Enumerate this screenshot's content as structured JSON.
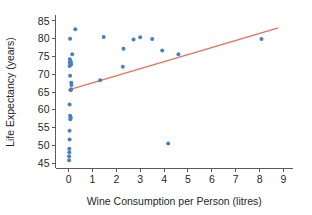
{
  "chart_data": {
    "type": "scatter",
    "title": "",
    "xlabel": "Wine Consumption per Person (litres)",
    "ylabel": "Life Expectancy (years)",
    "xlim": [
      -0.55,
      9.4
    ],
    "ylim": [
      43.6,
      86.4
    ],
    "xticks": [
      0,
      1,
      2,
      3,
      4,
      5,
      6,
      7,
      8,
      9
    ],
    "yticks": [
      45,
      50,
      55,
      60,
      65,
      70,
      75,
      80,
      85
    ],
    "xtick_labels": [
      "0",
      "1",
      "2",
      "3",
      "4",
      "5",
      "6",
      "7",
      "8",
      "9"
    ],
    "ytick_labels": [
      "45",
      "50",
      "55",
      "60",
      "65",
      "70",
      "75",
      "80",
      "85"
    ],
    "grid": false,
    "legend": false,
    "marker_color": "#4a7fc0",
    "marker_size": 4,
    "trendline": {
      "color": "#e8705a",
      "width": 1.4,
      "x_start": 0.0,
      "y_start": 65.6,
      "x_end": 8.75,
      "y_end": 83.0
    },
    "points": [
      {
        "x": 0.02,
        "y": 45.8
      },
      {
        "x": 0.02,
        "y": 46.9
      },
      {
        "x": 0.03,
        "y": 48.0
      },
      {
        "x": 0.03,
        "y": 49.0
      },
      {
        "x": 0.04,
        "y": 51.6
      },
      {
        "x": 0.04,
        "y": 54.1
      },
      {
        "x": 0.07,
        "y": 57.3
      },
      {
        "x": 0.09,
        "y": 57.8
      },
      {
        "x": 0.06,
        "y": 58.3
      },
      {
        "x": 0.04,
        "y": 61.5
      },
      {
        "x": 0.09,
        "y": 65.5
      },
      {
        "x": 0.1,
        "y": 65.8
      },
      {
        "x": 0.12,
        "y": 67.0
      },
      {
        "x": 0.11,
        "y": 67.6
      },
      {
        "x": 0.06,
        "y": 69.6
      },
      {
        "x": 0.04,
        "y": 72.3
      },
      {
        "x": 0.08,
        "y": 72.6
      },
      {
        "x": 0.11,
        "y": 72.9
      },
      {
        "x": 0.05,
        "y": 73.3
      },
      {
        "x": 0.09,
        "y": 73.6
      },
      {
        "x": 0.05,
        "y": 74.2
      },
      {
        "x": 0.15,
        "y": 75.6
      },
      {
        "x": 0.06,
        "y": 80.0
      },
      {
        "x": 0.28,
        "y": 82.7
      },
      {
        "x": 1.32,
        "y": 68.3
      },
      {
        "x": 1.47,
        "y": 80.5
      },
      {
        "x": 2.27,
        "y": 72.1
      },
      {
        "x": 2.3,
        "y": 77.2
      },
      {
        "x": 2.72,
        "y": 79.8
      },
      {
        "x": 3.0,
        "y": 80.4
      },
      {
        "x": 3.5,
        "y": 79.9
      },
      {
        "x": 3.92,
        "y": 76.7
      },
      {
        "x": 4.17,
        "y": 50.5
      },
      {
        "x": 4.6,
        "y": 75.6
      },
      {
        "x": 8.08,
        "y": 79.9
      }
    ]
  }
}
